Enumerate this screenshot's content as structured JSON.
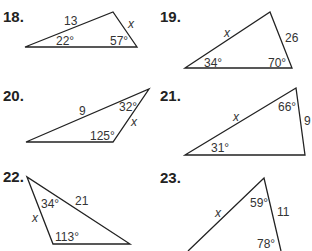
{
  "problems": [
    {
      "number": "18.",
      "side_label": "13",
      "variable": "x",
      "angles": [
        "22°",
        "57°"
      ]
    },
    {
      "number": "19.",
      "side_label": "26",
      "variable": "x",
      "angles": [
        "34°",
        "70°"
      ]
    },
    {
      "number": "20.",
      "side_label": "9",
      "variable": "x",
      "angles": [
        "32°",
        "125°"
      ]
    },
    {
      "number": "21.",
      "side_label": "9",
      "variable": "x",
      "angles": [
        "66°",
        "31°"
      ]
    },
    {
      "number": "22.",
      "side_label": "21",
      "variable": "x",
      "angles": [
        "34°",
        "113°"
      ]
    },
    {
      "number": "23.",
      "side_label": "11",
      "variable": "x",
      "angles": [
        "59°",
        "78°"
      ]
    }
  ]
}
